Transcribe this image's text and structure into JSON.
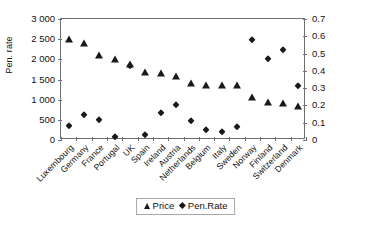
{
  "chart_data": {
    "type": "scatter",
    "title": "",
    "xlabel": "",
    "ylabel": "Price",
    "y2label": "Pen. rate",
    "grid": false,
    "legend_position": "bottom-center",
    "categories": [
      "Luxembourg",
      "Germany",
      "France",
      "Portugal",
      "UK",
      "Spain",
      "Ireland",
      "Austria",
      "Netherlands",
      "Belgium",
      "Italy",
      "Sweden",
      "Norway",
      "Finland",
      "Switzerland",
      "Denmark"
    ],
    "ylim": [
      0,
      3000
    ],
    "yticks": [
      "0",
      "500",
      "1 000",
      "1 500",
      "2 000",
      "2 500",
      "3 000"
    ],
    "ytick_values": [
      0,
      500,
      1000,
      1500,
      2000,
      2500,
      3000
    ],
    "y2lim": [
      0,
      0.7
    ],
    "y2ticks": [
      "0",
      "0.1",
      "0.2",
      "0.3",
      "0.4",
      "0.5",
      "0.6",
      "0.7"
    ],
    "y2tick_values": [
      0,
      0.1,
      0.2,
      0.3,
      0.4,
      0.5,
      0.6,
      0.7
    ],
    "series": [
      {
        "name": "Price",
        "marker": "triangle",
        "axis": "left",
        "color": "#1a1a1a",
        "values": [
          2520,
          2420,
          2140,
          2030,
          1900,
          1720,
          1690,
          1600,
          1440,
          1400,
          1390,
          1390,
          1100,
          970,
          950,
          870
        ]
      },
      {
        "name": "Pen.Rate",
        "marker": "diamond",
        "axis": "right",
        "color": "#1a1a1a",
        "values": [
          0.08,
          0.145,
          0.115,
          0.015,
          0.43,
          0.03,
          0.155,
          0.2,
          0.11,
          0.055,
          0.045,
          0.075,
          0.58,
          0.47,
          0.52,
          0.31
        ]
      }
    ]
  },
  "axes": {
    "left_title": "Price",
    "right_title": "Pen. rate"
  },
  "legend": {
    "items": [
      {
        "label": "Price",
        "marker": "triangle-icon"
      },
      {
        "label": "Pen.Rate",
        "marker": "diamond-icon"
      }
    ]
  }
}
